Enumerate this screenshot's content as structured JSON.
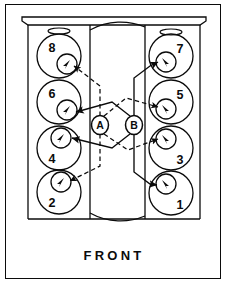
{
  "diagram": {
    "orientation_label": "FRONT",
    "line_color": "#0b0b0b",
    "background_color": "#ffffff",
    "border_color": "#0b0b0b"
  },
  "banks": {
    "left": {
      "name": "left-bank",
      "cylinders": [
        {
          "number": "8",
          "cx": 59,
          "cy": 56,
          "r_outer": 22,
          "inner_cx": 67,
          "inner_cy": 64,
          "r_inner": 10,
          "num_x": 52,
          "num_y": 41,
          "arrow_dir": "down-left"
        },
        {
          "number": "6",
          "cx": 59,
          "cy": 102,
          "r_outer": 22,
          "inner_cx": 67,
          "inner_cy": 110,
          "r_inner": 10,
          "num_x": 52,
          "num_y": 87,
          "arrow_dir": "down-left"
        },
        {
          "number": "4",
          "cx": 59,
          "cy": 148,
          "r_outer": 22,
          "inner_cx": 61,
          "inner_cy": 138,
          "r_inner": 10,
          "num_x": 52,
          "num_y": 152,
          "arrow_dir": "down-left"
        },
        {
          "number": "2",
          "cx": 59,
          "cy": 192,
          "r_outer": 22,
          "inner_cx": 61,
          "inner_cy": 182,
          "r_inner": 10,
          "num_x": 52,
          "num_y": 196,
          "arrow_dir": "down-left"
        }
      ]
    },
    "right": {
      "name": "right-bank",
      "cylinders": [
        {
          "number": "7",
          "cx": 171,
          "cy": 56,
          "r_outer": 22,
          "inner_cx": 166,
          "inner_cy": 62,
          "r_inner": 10,
          "num_x": 173,
          "num_y": 42,
          "arrow_dir": "down-right"
        },
        {
          "number": "5",
          "cx": 171,
          "cy": 102,
          "r_outer": 22,
          "inner_cx": 166,
          "inner_cy": 109,
          "r_inner": 10,
          "num_x": 173,
          "num_y": 88,
          "arrow_dir": "down-right"
        },
        {
          "number": "3",
          "cx": 171,
          "cy": 148,
          "r_outer": 22,
          "inner_cx": 166,
          "inner_cy": 139,
          "r_inner": 10,
          "num_x": 173,
          "num_y": 153,
          "arrow_dir": "down-right"
        },
        {
          "number": "1",
          "cx": 171,
          "cy": 193,
          "r_outer": 22,
          "inner_cx": 166,
          "inner_cy": 184,
          "r_inner": 10,
          "num_x": 173,
          "num_y": 198,
          "arrow_dir": "down-right"
        }
      ]
    }
  },
  "terminals": [
    {
      "label": "A",
      "cx": 100,
      "cy": 125,
      "rx": 8.5,
      "ry": 9.5,
      "line_style": "dashed"
    },
    {
      "label": "B",
      "cx": 134,
      "cy": 125,
      "rx": 8.5,
      "ry": 9.5,
      "line_style": "solid"
    }
  ],
  "oil_slots": [
    {
      "name": "left-slot",
      "cx": 59,
      "cy": 31,
      "rx": 11,
      "ry": 3
    },
    {
      "name": "right-slot",
      "cx": 171,
      "cy": 32,
      "rx": 11,
      "ry": 3
    }
  ],
  "wire_sets": {
    "dashed_terminal": "A",
    "solid_terminal": "B"
  }
}
